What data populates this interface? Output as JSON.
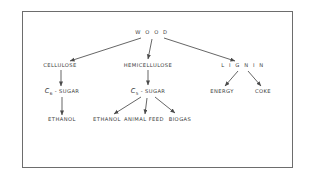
{
  "figure": {
    "type": "tree-diagram",
    "border_color": "#6d6d6d",
    "text_color": "#3a3a3a",
    "background": "#ffffff"
  },
  "nodes": {
    "root": {
      "label": "W O O D",
      "x": 152,
      "y": 33
    },
    "cellulose": {
      "label": "CELLULOSE",
      "x": 60,
      "y": 66
    },
    "hemicellulose": {
      "label": "HEMICELLULOSE",
      "x": 148,
      "y": 66
    },
    "lignin": {
      "label": "L I G N I N",
      "x": 243,
      "y": 66
    },
    "c6_sugar": {
      "base": "C",
      "sub": "6",
      "tail": " - SUGAR",
      "x": 62,
      "y": 92
    },
    "c5_sugar": {
      "base": "C",
      "sub": "5",
      "tail": " - SUGAR",
      "x": 148,
      "y": 92
    },
    "energy": {
      "label": "ENERGY",
      "x": 222,
      "y": 92
    },
    "coke": {
      "label": "COKE",
      "x": 263,
      "y": 92
    },
    "ethanol_left": {
      "label": "ETHANOL",
      "x": 62,
      "y": 120
    },
    "ethanol_mid": {
      "label": "ETHANOL",
      "x": 107,
      "y": 120
    },
    "animal_feed": {
      "label": "ANIMAL FEED",
      "x": 144,
      "y": 120
    },
    "biogas": {
      "label": "BIOGAS",
      "x": 180,
      "y": 120
    }
  },
  "edges": [
    {
      "name": "wood-to-cellulose",
      "d": "M 141 38 L 70 61"
    },
    {
      "name": "wood-to-hemicellulose",
      "d": "M 152 39 L 148 59"
    },
    {
      "name": "wood-to-lignin",
      "d": "M 164 38 L 235 61"
    },
    {
      "name": "cellulose-to-c6",
      "d": "M 61 70 L 61 86"
    },
    {
      "name": "c6-to-ethanol",
      "d": "M 62 97 L 62 115"
    },
    {
      "name": "hemicellulose-to-c5",
      "d": "M 148 70 L 148 85"
    },
    {
      "name": "c5-to-ethanol",
      "d": "M 141 97 L 114 114"
    },
    {
      "name": "c5-to-animal-feed",
      "d": "M 147 98 L 145 114"
    },
    {
      "name": "c5-to-biogas",
      "d": "M 155 97 L 175 113"
    },
    {
      "name": "lignin-to-energy",
      "d": "M 238 71 L 225 86"
    },
    {
      "name": "lignin-to-coke",
      "d": "M 248 71 L 261 86"
    }
  ]
}
